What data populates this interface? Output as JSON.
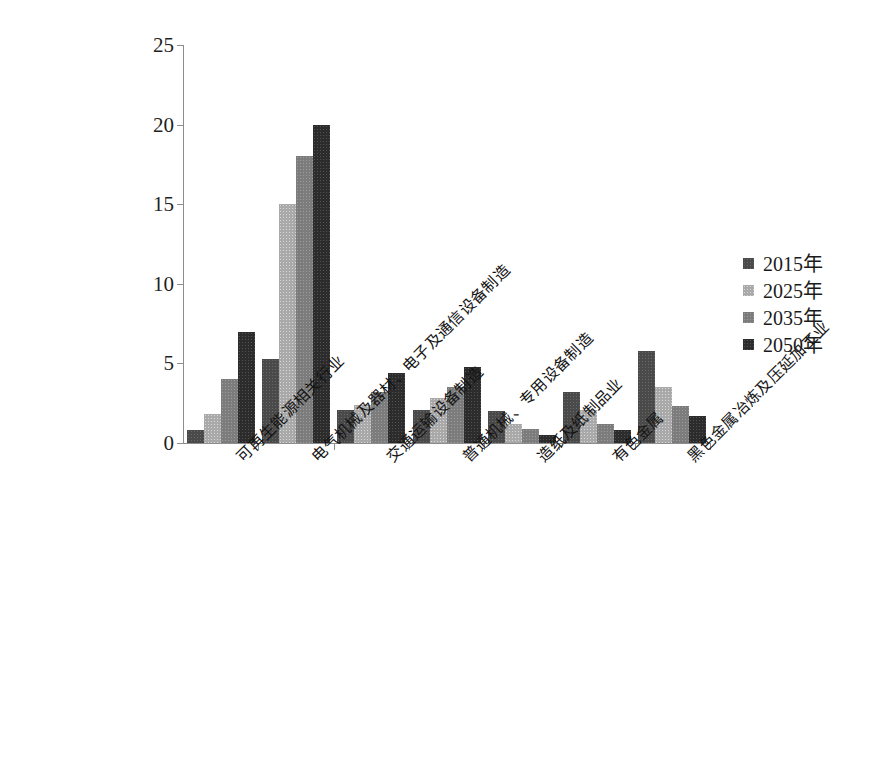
{
  "chart_data": {
    "type": "bar",
    "title": "",
    "xlabel": "",
    "ylabel": "",
    "ylim": [
      0,
      25
    ],
    "ytick_values": [
      0,
      5,
      10,
      15,
      20,
      25
    ],
    "ytick_labels": [
      "0",
      "5",
      "10",
      "15",
      "20",
      "25"
    ],
    "grid": false,
    "legend_position": "right",
    "categories": [
      "可再生能源相关行业",
      "电气机械及器材、电子及通信设备制造",
      "交通运输设备制造",
      "普通机械、专用设备制造",
      "造纸及纸制品业",
      "有色金属",
      "黑色金属冶炼及压延加工业"
    ],
    "series": [
      {
        "name": "2015年",
        "color": "#4a4a4a",
        "values": [
          0.8,
          5.3,
          2.1,
          2.1,
          2.0,
          3.2,
          5.8
        ]
      },
      {
        "name": "2025年",
        "color": "#a9a9a9",
        "values": [
          1.8,
          15.0,
          2.4,
          2.8,
          1.2,
          2.1,
          3.5
        ]
      },
      {
        "name": "2035年",
        "color": "#7c7c7c",
        "values": [
          4.0,
          18.0,
          3.2,
          3.5,
          0.9,
          1.2,
          2.3
        ]
      },
      {
        "name": "2050年",
        "color": "#2c2c2c",
        "values": [
          7.0,
          20.0,
          4.4,
          4.8,
          0.5,
          0.8,
          1.7
        ]
      }
    ]
  },
  "legend": {
    "entries": [
      {
        "label": "2015年"
      },
      {
        "label": "2025年"
      },
      {
        "label": "2035年"
      },
      {
        "label": "2050年"
      }
    ]
  }
}
